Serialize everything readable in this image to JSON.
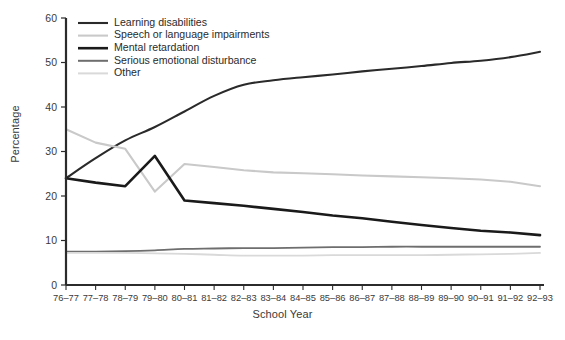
{
  "chart_data": {
    "type": "line",
    "title": "",
    "xlabel": "School Year",
    "ylabel": "Percentage",
    "grid": false,
    "legend_position": "top-left",
    "ylim": [
      0,
      60
    ],
    "yticks": [
      0,
      10,
      20,
      30,
      40,
      50,
      60
    ],
    "categories": [
      "76–77",
      "77–78",
      "78–79",
      "79–80",
      "80–81",
      "81–82",
      "82–83",
      "83–84",
      "84–85",
      "85–86",
      "86–87",
      "87–88",
      "88–89",
      "89–90",
      "90–91",
      "91–92",
      "92–93"
    ],
    "series": [
      {
        "name": "Learning disabilities",
        "color": "#2a2a2a",
        "width": 2.1,
        "values": [
          24.0,
          28.5,
          32.5,
          35.5,
          39.0,
          42.5,
          45.0,
          46.0,
          46.7,
          47.3,
          48.0,
          48.6,
          49.2,
          49.9,
          50.4,
          51.2,
          52.4
        ]
      },
      {
        "name": "Speech or language impairments",
        "color": "#c9c9c9",
        "width": 2.1,
        "values": [
          35.0,
          32.0,
          30.6,
          21.0,
          27.2,
          26.5,
          25.8,
          25.3,
          25.1,
          24.9,
          24.6,
          24.4,
          24.2,
          24.0,
          23.7,
          23.2,
          22.2
        ]
      },
      {
        "name": "Mental retardation",
        "color": "#1a1a1a",
        "width": 2.6,
        "values": [
          24.0,
          23.0,
          22.2,
          29.0,
          19.0,
          18.4,
          17.8,
          17.1,
          16.4,
          15.6,
          15.0,
          14.2,
          13.5,
          12.8,
          12.2,
          11.8,
          11.2
        ]
      },
      {
        "name": "Serious emotional disturbance",
        "color": "#6e6e6e",
        "width": 1.8,
        "values": [
          7.5,
          7.5,
          7.6,
          7.8,
          8.1,
          8.2,
          8.3,
          8.3,
          8.4,
          8.5,
          8.5,
          8.6,
          8.6,
          8.6,
          8.6,
          8.6,
          8.6
        ]
      },
      {
        "name": "Other",
        "color": "#d9d9d9",
        "width": 1.8,
        "values": [
          7.2,
          7.2,
          7.2,
          7.1,
          7.0,
          6.8,
          6.6,
          6.6,
          6.6,
          6.7,
          6.7,
          6.7,
          6.7,
          6.8,
          6.9,
          7.0,
          7.2
        ]
      }
    ]
  }
}
